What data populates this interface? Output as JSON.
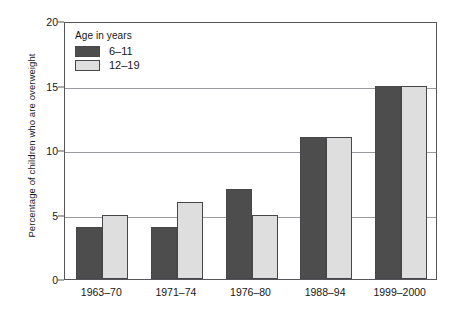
{
  "chart_data": {
    "type": "bar",
    "title": "",
    "xlabel": "",
    "ylabel": "Percentage of children who are overweight",
    "categories": [
      "1963–70",
      "1971–74",
      "1976–80",
      "1988–94",
      "1999–2000"
    ],
    "series": [
      {
        "name": "6–11",
        "color": "#4d4d4e",
        "values": [
          4,
          4,
          7,
          11,
          15
        ]
      },
      {
        "name": "12–19",
        "color": "#dedede",
        "values": [
          5,
          6,
          5,
          11,
          15
        ]
      }
    ],
    "ylim": [
      0,
      20
    ],
    "yticks": [
      0,
      5,
      10,
      15,
      20
    ],
    "ytick_labels": [
      "0",
      "5",
      "10",
      "15",
      "20"
    ],
    "grid": true,
    "legend_position": "top-left",
    "legend_title": "Age in years"
  },
  "colors": {
    "axis": "#55565a",
    "grid": "#9a9ba0",
    "text": "#171717",
    "background": "#ffffff",
    "series_dark": "#4d4d4e",
    "series_light": "#dedede"
  }
}
